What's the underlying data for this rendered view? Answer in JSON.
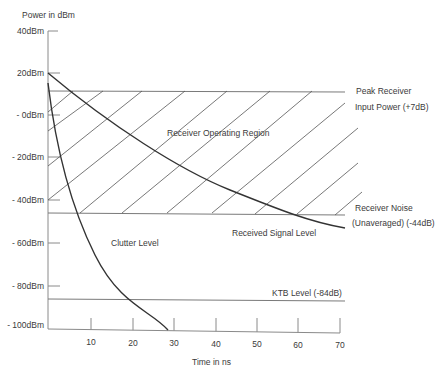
{
  "diagram": {
    "y_axis_title": "Power in dBm",
    "x_axis_title": "Time in ns",
    "y_ticks": [
      {
        "label": "40dBm",
        "y": 31
      },
      {
        "label": "20dBm",
        "y": 73
      },
      {
        "label": "- 0dBm",
        "y": 115
      },
      {
        "label": "- 20dBm",
        "y": 157
      },
      {
        "label": "- 40dBm",
        "y": 200
      },
      {
        "label": "- 60dBm",
        "y": 243
      },
      {
        "label": "- 80dBm",
        "y": 286
      },
      {
        "label": "- 100dBm",
        "y": 325
      }
    ],
    "x_ticks": [
      "10",
      "20",
      "30",
      "40",
      "50",
      "60",
      "70"
    ],
    "labels": {
      "operating_region": "Receiver Operating Region",
      "peak_line1": "Peak Receiver",
      "peak_line2": "Input Power (+7dB)",
      "noise_line1": "Receiver Noise",
      "noise_line2": "(Unaveraged) (-44dB)",
      "signal": "Received Signal Level",
      "clutter": "Clutter Level",
      "ktb": "KTB Level (-84dB)"
    },
    "levels": {
      "peak_receiver_input_power_db": 7,
      "receiver_noise_unaveraged_db": -44,
      "ktb_level_db": -84
    },
    "colors": {
      "axis": "#888888",
      "curve": "#333333",
      "hatch": "#555555",
      "text": "#3a3a3a"
    }
  }
}
